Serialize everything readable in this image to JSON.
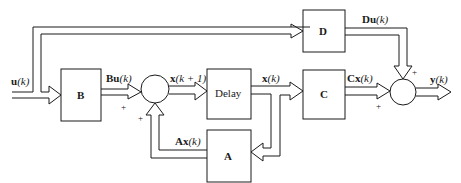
{
  "diagram": {
    "type": "block-diagram",
    "blocks": {
      "B": "B",
      "delay": "Delay",
      "A": "A",
      "C": "C",
      "D": "D"
    },
    "signals": {
      "input": "u(k)",
      "Bu": "Bu(k)",
      "x_next": "x(k + 1)",
      "x": "x(k)",
      "Ax": "Ax(k)",
      "Cx": "Cx(k)",
      "Du": "Du(k)",
      "output": "y(k)"
    },
    "signal_parts": {
      "input": {
        "bold": "u",
        "rest": "(k)"
      },
      "Bu": {
        "bold": "Bu",
        "rest": "(k)"
      },
      "x_next": {
        "bold": "x",
        "rest": "(k + 1)"
      },
      "x": {
        "bold": "x",
        "rest": "(k)"
      },
      "Ax": {
        "bold": "Ax",
        "rest": "(k)"
      },
      "Cx": {
        "bold": "Cx",
        "rest": "(k)"
      },
      "Du": {
        "bold": "Du",
        "rest": "(k)"
      },
      "output": {
        "bold": "y",
        "rest": "(k)"
      }
    },
    "summing_junctions": [
      {
        "id": "sum1",
        "inputs": [
          "Bu(k)",
          "Ax(k)"
        ],
        "signs": [
          "+",
          "+"
        ]
      },
      {
        "id": "sum2",
        "inputs": [
          "Cx(k)",
          "Du(k)"
        ],
        "signs": [
          "+",
          "+"
        ]
      }
    ],
    "sign_plus": "+"
  }
}
